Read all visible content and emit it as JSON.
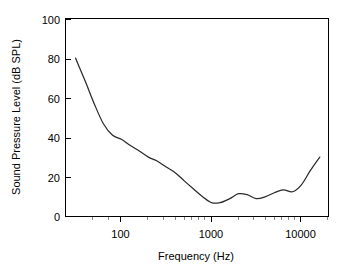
{
  "chart_data": {
    "type": "line",
    "title": "",
    "xlabel": "Frequency (Hz)",
    "ylabel": "Sound Pressure Level (dB SPL)",
    "xscale": "log",
    "yscale": "linear",
    "xlim": [
      24,
      20000
    ],
    "ylim": [
      0,
      100
    ],
    "grid": false,
    "legend": null,
    "x_tick_labels": [
      "100",
      "1000",
      "10000"
    ],
    "x_tick_values": [
      100,
      1000,
      10000
    ],
    "y_tick_labels": [
      "0",
      "20",
      "40",
      "60",
      "80",
      "100"
    ],
    "y_tick_values": [
      0,
      20,
      40,
      60,
      80,
      100
    ],
    "series": [
      {
        "name": "Hearing threshold",
        "color": "#2b2b2b",
        "x": [
          31,
          40,
          50,
          63,
          80,
          100,
          125,
          160,
          200,
          250,
          315,
          400,
          500,
          630,
          800,
          1000,
          1250,
          1600,
          2000,
          2500,
          3150,
          4000,
          5000,
          6300,
          8000,
          10000,
          12500,
          16000
        ],
        "y": [
          80,
          68,
          57,
          47,
          41,
          39,
          36,
          33,
          30,
          28,
          25,
          22,
          18,
          14,
          10,
          7,
          7,
          9,
          11.5,
          11,
          9,
          10,
          12,
          13.5,
          12.5,
          16,
          23,
          30
        ]
      }
    ]
  },
  "axis_titles": {
    "x": "Frequency (Hz)",
    "y": "Sound Pressure Level (dB SPL)"
  }
}
